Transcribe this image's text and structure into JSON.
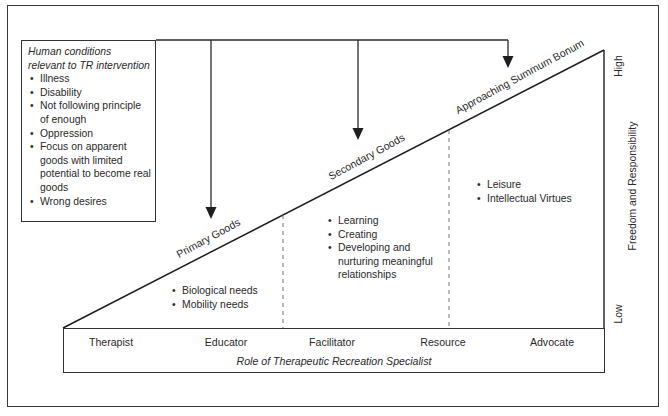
{
  "diagram": {
    "conditions_box": {
      "title": "Human conditions relevant to TR intervention",
      "items": [
        "Illness",
        "Disability",
        "Not following principle of enough",
        "Oppression",
        "Focus on apparent goods with limited potential to become real goods",
        "Wrong desires"
      ]
    },
    "slope_labels": {
      "primary": "Primary Goods",
      "secondary": "Secondary Goods",
      "summum": "Approaching Summum Bonum"
    },
    "zones": {
      "primary": [
        "Biological needs",
        "Mobility needs"
      ],
      "secondary": [
        "Learning",
        "Creating",
        "Developing and nurturing meaningful relationships"
      ],
      "summum": [
        "Leisure",
        "Intellectual Virtues"
      ]
    },
    "roles": [
      "Therapist",
      "Educator",
      "Facilitator",
      "Resource",
      "Advocate"
    ],
    "roles_caption": "Role of Therapeutic Recreation Specialist",
    "axis": {
      "label": "Freedom and Responsibility",
      "high": "High",
      "low": "Low"
    },
    "colors": {
      "line": "#2a2a2a",
      "dash": "#777777",
      "background": "#ffffff"
    }
  }
}
